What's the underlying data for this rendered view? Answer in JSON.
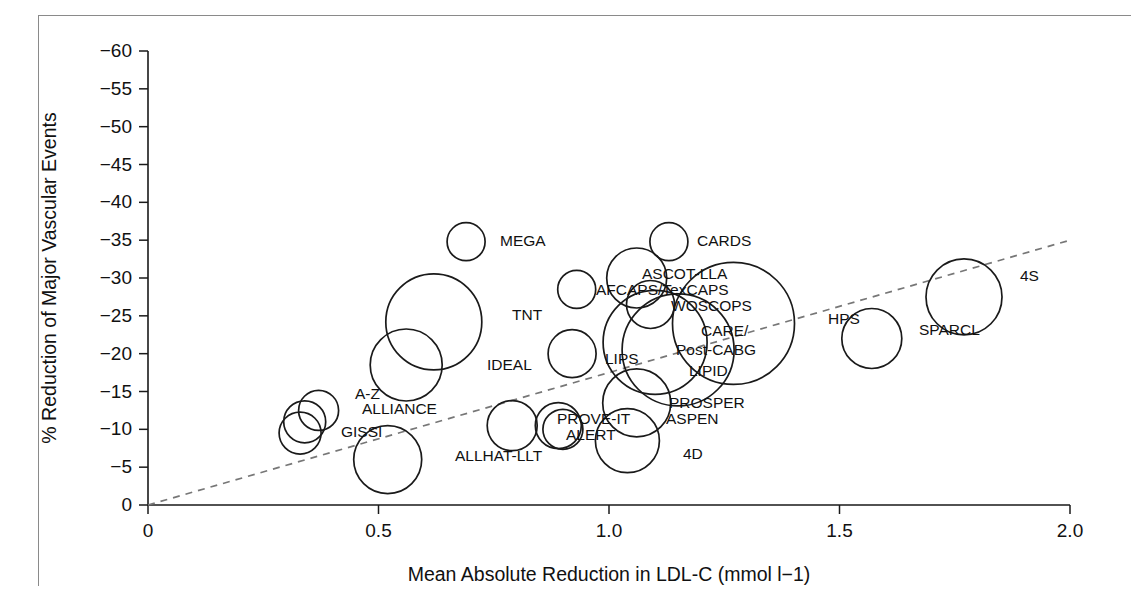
{
  "figure": {
    "kind": "bubble-scatter",
    "has_border_frame": true,
    "border_color": "#8a8a8a"
  },
  "chart_data": {
    "type": "scatter",
    "title": "",
    "subtitle": "",
    "xlabel": "Mean Absolute Reduction in LDL-C (mmol l−1)",
    "ylabel": "% Reduction of Major Vascular Events",
    "xlim": [
      0,
      2.0
    ],
    "ylim": [
      0,
      -60
    ],
    "y_axis_inverted": true,
    "grid": false,
    "legend": false,
    "xticks": [
      "0",
      "0.5",
      "1.0",
      "1.5",
      "2.0"
    ],
    "xtick_values": [
      0,
      0.5,
      1.0,
      1.5,
      2.0
    ],
    "yticks": [
      "0",
      "−5",
      "−10",
      "−15",
      "−20",
      "−25",
      "−30",
      "−35",
      "−40",
      "−45",
      "−50",
      "−55",
      "−60"
    ],
    "ytick_values": [
      0,
      -5,
      -10,
      -15,
      -20,
      -25,
      -30,
      -35,
      -40,
      -45,
      -50,
      -55,
      -60
    ],
    "marker_style": "open-circle",
    "marker_size_meaning": "trial size / weight",
    "trendline": {
      "style": "dashed",
      "color": "#777777",
      "x_start": 0.0,
      "y_start": 0.0,
      "x_end": 2.0,
      "y_end": -35.0
    },
    "points": [
      {
        "label": "MEGA",
        "x": 0.69,
        "y": -34.8,
        "r": 19
      },
      {
        "label": "CARDS",
        "x": 1.13,
        "y": -34.8,
        "r": 19
      },
      {
        "label": "ASCOT-LLA",
        "x": 1.06,
        "y": -30.0,
        "r": 30
      },
      {
        "label": "AFCAPS/TexCAPS",
        "x": 0.93,
        "y": -28.5,
        "r": 19
      },
      {
        "label": "WOSCOPS",
        "x": 1.09,
        "y": -26.5,
        "r": 24
      },
      {
        "label": "TNT",
        "x": 0.62,
        "y": -24.2,
        "r": 48
      },
      {
        "label": "CARE/Post-CABG",
        "x": 1.27,
        "y": -24.0,
        "r": 61
      },
      {
        "label": "4S",
        "x": 1.77,
        "y": -27.5,
        "r": 38
      },
      {
        "label": "SPARCL",
        "x": 1.57,
        "y": -22.0,
        "r": 30
      },
      {
        "label": "HPS",
        "x": 1.15,
        "y": -20.5,
        "r": 56
      },
      {
        "label": "LIPID",
        "x": 1.1,
        "y": -21.5,
        "r": 52
      },
      {
        "label": "LIPS",
        "x": 0.92,
        "y": -20.0,
        "r": 24
      },
      {
        "label": "IDEAL",
        "x": 0.56,
        "y": -18.5,
        "r": 36
      },
      {
        "label": "PROSPER",
        "x": 1.06,
        "y": -13.5,
        "r": 34
      },
      {
        "label": "ASPEN",
        "x": 1.04,
        "y": -8.5,
        "r": 32
      },
      {
        "label": "A-Z",
        "x": 0.37,
        "y": -12.5,
        "r": 20
      },
      {
        "label": "ALLIANCE",
        "x": 0.34,
        "y": -11.0,
        "r": 21
      },
      {
        "label": "GISSI",
        "x": 0.33,
        "y": -9.5,
        "r": 21
      },
      {
        "label": "PROVE-IT",
        "x": 0.89,
        "y": -10.5,
        "r": 23
      },
      {
        "label": "ALERT",
        "x": 0.9,
        "y": -10.0,
        "r": 20
      },
      {
        "label": "ALLHAT-LLT",
        "x": 0.79,
        "y": -10.5,
        "r": 25
      },
      {
        "label": "4D",
        "x": 0.52,
        "y": -6.0,
        "r": 34
      }
    ],
    "annotations": [
      {
        "text": "MEGA",
        "x": 500,
        "y": 246
      },
      {
        "text": "CARDS",
        "x": 697,
        "y": 246
      },
      {
        "text": "ASCOT-LLA",
        "x": 642,
        "y": 279
      },
      {
        "text": "AFCAPS/TexCAPS",
        "x": 596,
        "y": 295
      },
      {
        "text": "WOSCOPS",
        "x": 671,
        "y": 311
      },
      {
        "text": "TNT",
        "x": 512,
        "y": 320
      },
      {
        "text": "HPS",
        "x": 828,
        "y": 324
      },
      {
        "text": "SPARCL",
        "x": 919,
        "y": 335
      },
      {
        "text": "4S",
        "x": 1020,
        "y": 281
      },
      {
        "text": "CARE/",
        "x": 701,
        "y": 336
      },
      {
        "text": "Post-CABG",
        "x": 676,
        "y": 355
      },
      {
        "text": "LIPS",
        "x": 605,
        "y": 364
      },
      {
        "text": "IDEAL",
        "x": 487,
        "y": 370
      },
      {
        "text": "LIPID",
        "x": 689,
        "y": 376
      },
      {
        "text": "A-Z",
        "x": 355,
        "y": 399
      },
      {
        "text": "ALLIANCE",
        "x": 362,
        "y": 414
      },
      {
        "text": "PROSPER",
        "x": 669,
        "y": 408
      },
      {
        "text": "ASPEN",
        "x": 666,
        "y": 424
      },
      {
        "text": "GISSI",
        "x": 341,
        "y": 437
      },
      {
        "text": "PROVE-IT",
        "x": 557,
        "y": 424
      },
      {
        "text": "ALERT",
        "x": 566,
        "y": 440
      },
      {
        "text": "ALLHAT-LLT",
        "x": 455,
        "y": 461
      },
      {
        "text": "4D",
        "x": 683,
        "y": 459
      }
    ]
  }
}
